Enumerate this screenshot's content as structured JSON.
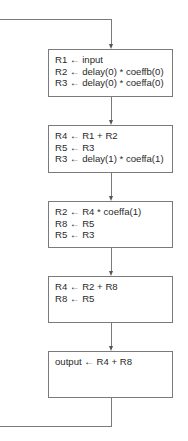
{
  "diagram": {
    "type": "flowchart",
    "feedback_loop": "output returns to top (loop)",
    "boxes": [
      {
        "id": "box1",
        "lines": [
          "R1 ← input",
          "R2 ← delay(0) * coeffb(0)",
          "R3 ← delay(0) * coeffa(0)"
        ]
      },
      {
        "id": "box2",
        "lines": [
          "R4 ← R1 + R2",
          "R5 ← R3",
          "R3 ← delay(1) * coeffa(1)"
        ]
      },
      {
        "id": "box3",
        "lines": [
          "R2 ← R4 * coeffa(1)",
          "R8 ← R5",
          "R5 ← R3"
        ]
      },
      {
        "id": "box4",
        "lines": [
          "R4 ← R2 + R8",
          "R8 ← R5"
        ]
      },
      {
        "id": "box5",
        "lines": [
          "output ← R4 + R8"
        ]
      }
    ],
    "colors": {
      "line": "#7a7a7a",
      "text": "#2a2a2a",
      "background": "#ffffff"
    }
  }
}
